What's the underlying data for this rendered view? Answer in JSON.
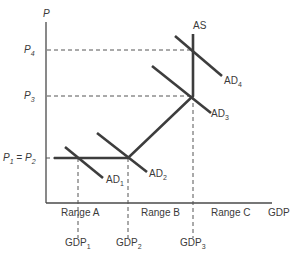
{
  "diagram": {
    "type": "aggregate-supply-demand",
    "axes": {
      "y_label": "P",
      "x_label": "GDP"
    },
    "price_levels": [
      {
        "label": "P",
        "sub": "4",
        "id": "P4"
      },
      {
        "label": "P",
        "sub": "3",
        "id": "P3"
      },
      {
        "label": "P",
        "sub": "1",
        "mid": " = P",
        "sub2": "2",
        "id": "P1=P2"
      }
    ],
    "gdp_levels": [
      {
        "label": "GDP",
        "sub": "1"
      },
      {
        "label": "GDP",
        "sub": "2"
      },
      {
        "label": "GDP",
        "sub": "3"
      }
    ],
    "ranges": [
      "Range A",
      "Range B",
      "Range C"
    ],
    "curves": {
      "supply": "AS",
      "demand": [
        {
          "label": "AD",
          "sub": "1"
        },
        {
          "label": "AD",
          "sub": "2"
        },
        {
          "label": "AD",
          "sub": "3"
        },
        {
          "label": "AD",
          "sub": "4"
        }
      ]
    },
    "colors": {
      "line": "#3d3d3d",
      "text": "#3a3a3a",
      "background": "#ffffff"
    }
  }
}
